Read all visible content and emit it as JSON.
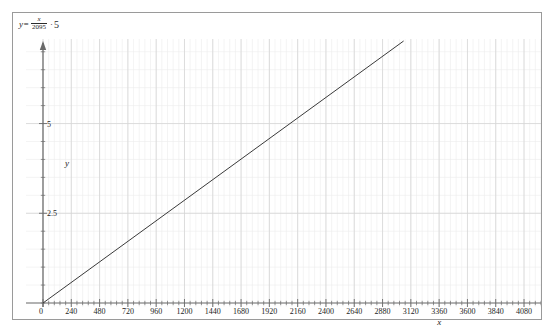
{
  "equation": {
    "lhs": "y=",
    "numerator": "x",
    "denominator": "2095",
    "operator": "·",
    "coefficient": "5"
  },
  "axis_labels": {
    "x": "x",
    "y": "y"
  },
  "colors": {
    "line": "#3a3a3a",
    "axis": "#6a6a6a",
    "grid_major": "#d6d6d6",
    "grid_minor": "#ededed",
    "frame": "#9a9a9a",
    "text": "#1c1c1c"
  },
  "chart_data": {
    "type": "line",
    "title": "",
    "subtitle": "",
    "xlabel": "x",
    "ylabel": "y",
    "xlim": [
      0,
      4224
    ],
    "ylim": [
      0,
      7.3
    ],
    "grid": true,
    "legend": "none",
    "x_major_step": 240,
    "x_minor_step": 48,
    "y_major_step": 2.5,
    "y_minor_step": 0.5,
    "xticks": [
      0,
      240,
      480,
      720,
      960,
      1200,
      1440,
      1680,
      1920,
      2160,
      2400,
      2640,
      2880,
      3120,
      3360,
      3600,
      3840,
      4080
    ],
    "xticklabels": [
      "0",
      "240",
      "480",
      "720",
      "960",
      "1200",
      "1440",
      "1680",
      "1920",
      "2160",
      "2400",
      "2640",
      "2880",
      "3120",
      "3360",
      "3600",
      "3840",
      "4080"
    ],
    "yticks": [
      2.5,
      5
    ],
    "yticklabels": [
      "2.5",
      "5"
    ],
    "series": [
      {
        "name": "y = (x/2095)·5",
        "slope": 0.002386634844868735,
        "intercept": 0,
        "x": [
          0,
          4224
        ],
        "values": [
          0,
          10.08
        ]
      }
    ],
    "annotations": [
      {
        "text": "y=x/2095·5",
        "position": "top-left"
      }
    ]
  }
}
